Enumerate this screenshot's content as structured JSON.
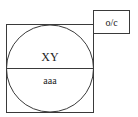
{
  "diagram": {
    "circle_top_label": "XY",
    "circle_bottom_label": "aaa",
    "corner_box_label": "o/c",
    "stroke_color": "#3a3a3a",
    "background_color": "#ffffff"
  }
}
